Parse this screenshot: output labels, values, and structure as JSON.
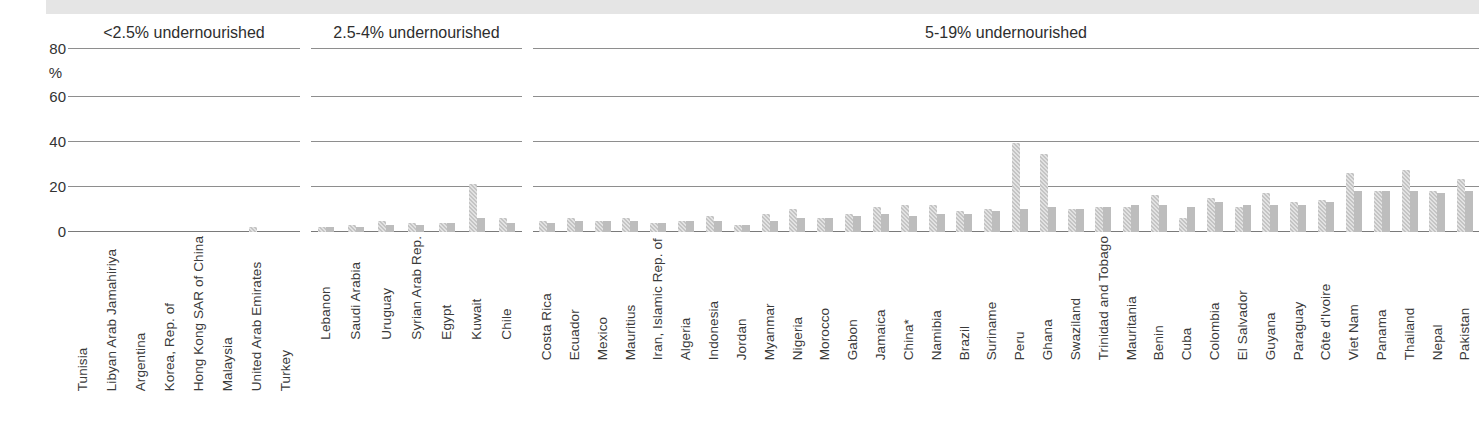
{
  "figure": {
    "y_axis": {
      "unit_label": "%",
      "ticks": [
        "0",
        "20",
        "40",
        "60",
        "80"
      ]
    }
  },
  "chart_data": {
    "type": "bar",
    "title": "",
    "subtitle": "",
    "xlabel": "",
    "ylabel": "%",
    "ylim": [
      0,
      80
    ],
    "yticks": [
      0,
      20,
      40,
      60,
      80
    ],
    "grid": true,
    "legend_position": "none",
    "series": [
      {
        "name": "series-1",
        "style": "hatched-light"
      },
      {
        "name": "series-2",
        "style": "solid-gray"
      }
    ],
    "panels": [
      {
        "id": "panel-1",
        "title": "<2.5% undernourished",
        "categories": [
          "Tunisia",
          "Libyan Arab Jamahiriya",
          "Argentina",
          "Korea, Rep. of",
          "Hong Kong SAR of China",
          "Malaysia",
          "United Arab Emirates",
          "Turkey"
        ],
        "series": [
          {
            "name": "series-1",
            "values": [
              0,
              0,
              0,
              0,
              0,
              0,
              2,
              0
            ]
          },
          {
            "name": "series-2",
            "values": [
              0,
              0,
              0,
              0,
              0,
              0,
              0,
              0
            ]
          }
        ]
      },
      {
        "id": "panel-2",
        "title": "2.5-4% undernourished",
        "categories": [
          "Lebanon",
          "Saudi Arabia",
          "Uruguay",
          "Syrian Arab Rep.",
          "Egypt",
          "Kuwait",
          "Chile"
        ],
        "series": [
          {
            "name": "series-1",
            "values": [
              2,
              3,
              5,
              4,
              4,
              21,
              6
            ]
          },
          {
            "name": "series-2",
            "values": [
              2,
              2,
              3,
              3,
              4,
              6,
              4
            ]
          }
        ]
      },
      {
        "id": "panel-3",
        "title": "5-19% undernourished",
        "categories": [
          "Costa Rica",
          "Ecuador",
          "Mexico",
          "Mauritius",
          "Iran, Islamic Rep. of",
          "Algeria",
          "Indonesia",
          "Jordan",
          "Myanmar",
          "Nigeria",
          "Morocco",
          "Gabon",
          "Jamaica",
          "China*",
          "Namibia",
          "Brazil",
          "Suriname",
          "Peru",
          "Ghana",
          "Swaziland",
          "Trinidad and Tobago",
          "Mauritania",
          "Benin",
          "Cuba",
          "Colombia",
          "El Salvador",
          "Guyana",
          "Paraguay",
          "Côte d'Ivoire",
          "Viet Nam",
          "Panama",
          "Thailand",
          "Nepal",
          "Pakistan"
        ],
        "series": [
          {
            "name": "series-1",
            "values": [
              5,
              6,
              5,
              6,
              4,
              5,
              7,
              3,
              8,
              10,
              6,
              8,
              11,
              12,
              12,
              9,
              10,
              39,
              34,
              10,
              11,
              11,
              16,
              6,
              15,
              11,
              17,
              13,
              14,
              26,
              18,
              27,
              18,
              23
            ]
          },
          {
            "name": "series-2",
            "values": [
              4,
              5,
              5,
              5,
              4,
              5,
              5,
              3,
              5,
              6,
              6,
              7,
              8,
              7,
              8,
              8,
              9,
              10,
              11,
              10,
              11,
              12,
              12,
              11,
              13,
              12,
              12,
              12,
              13,
              18,
              18,
              18,
              17,
              18
            ]
          }
        ]
      }
    ]
  }
}
